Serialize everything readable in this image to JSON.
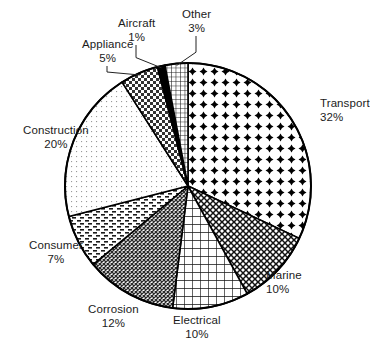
{
  "chart_data": {
    "type": "pie",
    "title": "",
    "subtitle": "",
    "xlabel": "",
    "ylabel": "",
    "legend_position": "none",
    "grid": false,
    "units": "percent",
    "start_angle_deg": 0,
    "direction": "clockwise",
    "categories": [
      "Transport",
      "Marine",
      "Electrical",
      "Corrosion",
      "Consumer",
      "Construction",
      "Appliance",
      "Aircraft",
      "Other"
    ],
    "values": [
      32,
      10,
      10,
      12,
      7,
      20,
      5,
      1,
      3
    ],
    "total": 100,
    "slices": [
      {
        "label": "Transport",
        "value": 32,
        "value_text": "32%",
        "pattern": "bold-cross-dots",
        "label_anchor": "right",
        "label_x": 320,
        "label_y": 97,
        "leader": false
      },
      {
        "label": "Marine",
        "value": 10,
        "value_text": "10%",
        "pattern": "diagonal-crosshatch",
        "label_anchor": "right",
        "label_x": 266,
        "label_y": 269,
        "leader": false
      },
      {
        "label": "Electrical",
        "value": 10,
        "value_text": "10%",
        "pattern": "square-lattice",
        "label_anchor": "center",
        "label_x": 197,
        "label_y": 314,
        "leader": false
      },
      {
        "label": "Corrosion",
        "value": 12,
        "value_text": "12%",
        "pattern": "dense-diagonal-mesh",
        "label_anchor": "center",
        "label_x": 113,
        "label_y": 303,
        "leader": false
      },
      {
        "label": "Consumer",
        "value": 7,
        "value_text": "7%",
        "pattern": "dashed-brick",
        "label_anchor": "center",
        "label_x": 56,
        "label_y": 239,
        "leader": false
      },
      {
        "label": "Construction",
        "value": 20,
        "value_text": "20%",
        "pattern": "fine-dots",
        "label_anchor": "center",
        "label_x": 56,
        "label_y": 124,
        "leader": false
      },
      {
        "label": "Appliance",
        "value": 5,
        "value_text": "5%",
        "pattern": "checkerboard",
        "label_anchor": "center",
        "label_x": 107,
        "label_y": 38,
        "leader": true
      },
      {
        "label": "Aircraft",
        "value": 1,
        "value_text": "1%",
        "pattern": "solid-black",
        "label_anchor": "center",
        "label_x": 136,
        "label_y": 17,
        "leader": true
      },
      {
        "label": "Other",
        "value": 3,
        "value_text": "3%",
        "pattern": "fine-grid",
        "label_anchor": "center",
        "label_x": 196,
        "label_y": 8,
        "leader": true
      }
    ],
    "geometry": {
      "center_x": 188,
      "center_y": 186,
      "radius": 123
    },
    "colors": {
      "stroke": "#000000",
      "fill": "#ffffff",
      "text": "#1b1b1b",
      "background": "#ffffff"
    }
  }
}
